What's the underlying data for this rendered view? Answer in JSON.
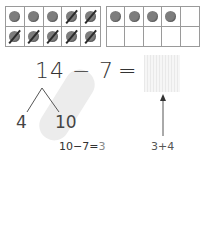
{
  "ten_frames": {
    "left": {
      "cells": [
        {
          "state": "dot"
        },
        {
          "state": "dot"
        },
        {
          "state": "dot"
        },
        {
          "state": "crossed"
        },
        {
          "state": "crossed"
        },
        {
          "state": "crossed"
        },
        {
          "state": "crossed"
        },
        {
          "state": "crossed"
        },
        {
          "state": "crossed"
        },
        {
          "state": "crossed"
        }
      ]
    },
    "right": {
      "cells": [
        {
          "state": "dot"
        },
        {
          "state": "dot"
        },
        {
          "state": "dot"
        },
        {
          "state": "dot"
        },
        {
          "state": "empty"
        },
        {
          "state": "empty"
        },
        {
          "state": "empty"
        },
        {
          "state": "empty"
        },
        {
          "state": "empty"
        },
        {
          "state": "empty"
        }
      ]
    }
  },
  "equation": {
    "minuend": "14",
    "operator": "−",
    "subtrahend": "7",
    "equals": "="
  },
  "decomposition": {
    "left_part": "4",
    "right_part": "10"
  },
  "notes": {
    "step_prefix": "10−7=",
    "step_result": "3",
    "sum": "3+4"
  },
  "colors": {
    "dot": "#7d7d7d",
    "grid": "#9a9a9a",
    "highlight_band": "#ececec",
    "text": "#333333"
  }
}
